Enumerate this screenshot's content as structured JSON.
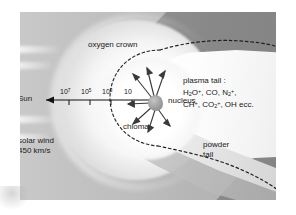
{
  "figure": {
    "labels": {
      "sun": "Sun",
      "oxygen_crown": "oxygen crown",
      "nucleus": "nucleus",
      "chioma": "chioma",
      "solar_wind_line1": "solar wind",
      "solar_wind_line2": "450 km/s",
      "powder_tail_line1": "powder",
      "powder_tail_line2": "tail",
      "plasma_tail_heading": "plasma tail :",
      "plasma_tail_species_line1": "H2O+, CO, N2+,",
      "plasma_tail_species_line2": "CH+, CO2+, OH ecc."
    },
    "scale_axis": {
      "description": "distance scale along Sun direction, powers of ten",
      "ticks": [
        "10^7",
        "10^5",
        "10^3",
        "10"
      ],
      "arrow_direction": "left toward Sun"
    },
    "colors": {
      "background_gray": "#b9b9b9",
      "sky_dark": "#8a8a8a",
      "coma_white": "#ffffff",
      "nucleus_gray": "#9a9a9a",
      "text": "#1a1a1a",
      "powder_tail": "#e2e2e2"
    }
  }
}
